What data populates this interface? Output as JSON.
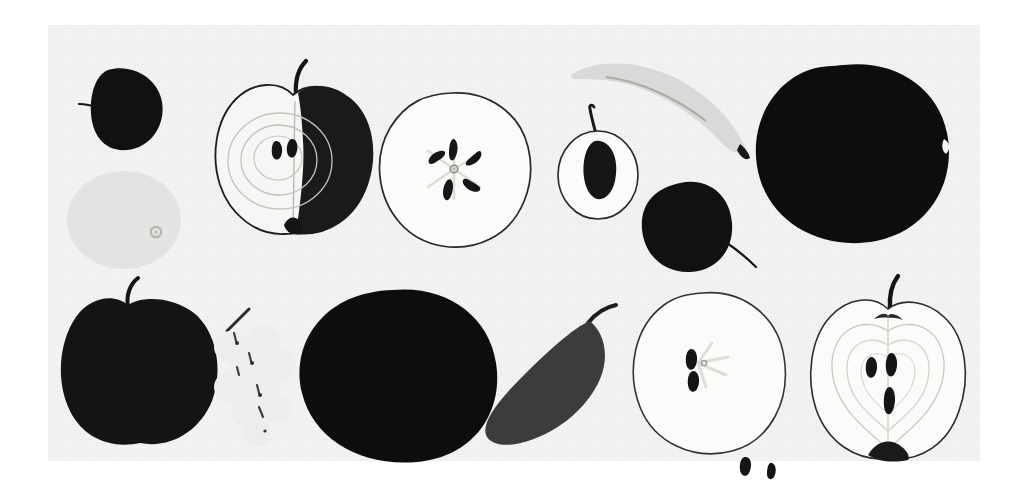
{
  "plate": {
    "title": "Fruit silhouettes and cross-sections study plate",
    "background_color": "#ffffff",
    "panel_color": "#f3f3f1",
    "panel": {
      "x": 48,
      "y": 25,
      "width": 932,
      "height": 436
    },
    "rows": 2,
    "item_count": 14,
    "ink_color": "#111111",
    "mid_gray": "#4a4a4a",
    "light_gray": "#d9d9d7",
    "pale_gray": "#e6e6e4"
  },
  "figures": [
    {
      "id": "dark-plum-stem",
      "name": "Dark round plum with stem",
      "row": 1,
      "kind": "silhouette",
      "fill": "#111111",
      "label": "plum"
    },
    {
      "id": "pale-orange",
      "name": "Pale grapefruit disc with navel",
      "row": 1,
      "kind": "flat-tone",
      "fill": "#e3e3e1",
      "label": "grapefruit"
    },
    {
      "id": "apple-half-shaded",
      "name": "Apple halved lengthwise, shaded right side",
      "row": 1,
      "kind": "cross-section",
      "fill": "#f6f6f4",
      "shade": "#1a1a1a",
      "seeds": 2,
      "label": "apple half"
    },
    {
      "id": "apple-transverse",
      "name": "Apple sliced across showing five-point seed star",
      "row": 1,
      "kind": "cross-section",
      "fill": "#fbfbf9",
      "seeds": 5,
      "label": "apple slice"
    },
    {
      "id": "cherry-outline-pit",
      "name": "Cherry outline with dark pit and stem",
      "row": 1,
      "kind": "outline",
      "fill": "#fbfbf9",
      "seeds": 1,
      "label": "cherry"
    },
    {
      "id": "banana",
      "name": "Banana crescent, light tone with dark tip",
      "row": 1,
      "kind": "flat-tone",
      "fill": "#d9d9d7",
      "label": "banana"
    },
    {
      "id": "dark-cherry-stem",
      "name": "Dark cherry with trailing stem",
      "row": 1,
      "kind": "silhouette",
      "fill": "#111111",
      "label": "cherry"
    },
    {
      "id": "large-dark-oval",
      "name": "Large dark oval mango silhouette",
      "row": 1,
      "kind": "silhouette",
      "fill": "#0d0d0d",
      "label": "mango"
    },
    {
      "id": "dark-apple-stem",
      "name": "Dark apple silhouette with stem",
      "row": 2,
      "kind": "silhouette",
      "fill": "#141414",
      "label": "apple"
    },
    {
      "id": "grape-cluster",
      "name": "Faint grape cluster with stem",
      "row": 2,
      "kind": "flat-tone",
      "fill": "#ededeb",
      "label": "grapes"
    },
    {
      "id": "dark-round-blob",
      "name": "Large dark round fruit silhouette",
      "row": 2,
      "kind": "silhouette",
      "fill": "#0d0d0d",
      "label": "melon"
    },
    {
      "id": "pear-wedge",
      "name": "Tilted grey pear silhouette with curved stem",
      "row": 2,
      "kind": "silhouette",
      "fill": "#3c3c3c",
      "label": "pear"
    },
    {
      "id": "apple-transverse-two",
      "name": "Apple slice outline with two seeds and two loose seeds",
      "row": 2,
      "kind": "cross-section",
      "fill": "#fbfbf9",
      "seeds": 2,
      "loose_seeds": 2,
      "label": "apple slice"
    },
    {
      "id": "apple-half-core",
      "name": "Apple half outline showing core rings and three seeds",
      "row": 2,
      "kind": "cross-section",
      "fill": "#fbfbf9",
      "seeds": 3,
      "label": "apple half"
    }
  ]
}
